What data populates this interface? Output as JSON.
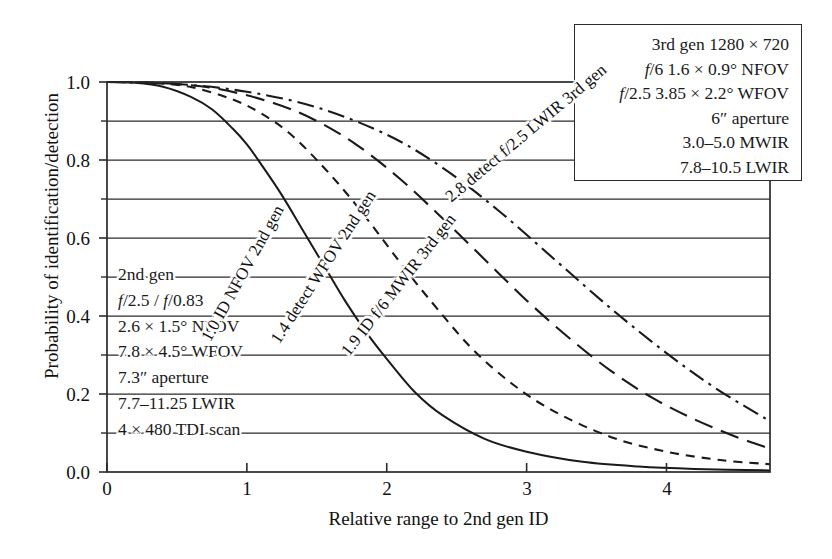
{
  "chart_data": {
    "type": "line",
    "title": "",
    "xlabel": "Relative range to 2nd gen ID",
    "ylabel": "Probability of identification/detection",
    "xlim": [
      0,
      4.74
    ],
    "ylim": [
      0.0,
      1.0
    ],
    "xticks": [
      "0",
      "1",
      "2",
      "3",
      "4"
    ],
    "xtick_values": [
      0,
      1,
      2,
      3,
      4
    ],
    "yticks": [
      "0.0",
      "0.2",
      "0.4",
      "0.6",
      "0.8",
      "1.0"
    ],
    "ytick_values": [
      0.0,
      0.2,
      0.4,
      0.6,
      0.8,
      1.0
    ],
    "y_minor_ticks": [
      0.1,
      0.3,
      0.5,
      0.7,
      0.9
    ],
    "grid": "horizontal gridlines at every 0.1",
    "legend_position": "inline curve labels",
    "series": [
      {
        "name": "1.0 ID NFOV 2nd gen",
        "style": "solid",
        "range50": 1.0,
        "x": [
          0.0,
          0.2,
          0.4,
          0.6,
          0.75,
          0.9,
          1.0,
          1.1,
          1.25,
          1.4,
          1.55,
          1.7,
          1.85,
          2.0,
          2.2,
          2.4,
          2.7,
          3.0,
          3.4,
          3.8,
          4.2,
          4.74
        ],
        "y": [
          1.0,
          0.998,
          0.988,
          0.962,
          0.93,
          0.88,
          0.84,
          0.79,
          0.71,
          0.62,
          0.53,
          0.44,
          0.36,
          0.29,
          0.205,
          0.145,
          0.085,
          0.052,
          0.026,
          0.014,
          0.008,
          0.004
        ]
      },
      {
        "name": "1.4 detect WFOV 2nd gen",
        "style": "short-dash",
        "range50": 1.4,
        "x": [
          0.0,
          0.3,
          0.6,
          0.9,
          1.1,
          1.3,
          1.5,
          1.7,
          1.9,
          2.1,
          2.3,
          2.6,
          2.9,
          3.2,
          3.6,
          4.0,
          4.4,
          4.74
        ],
        "y": [
          1.0,
          0.998,
          0.987,
          0.955,
          0.92,
          0.87,
          0.8,
          0.72,
          0.63,
          0.535,
          0.445,
          0.32,
          0.225,
          0.155,
          0.09,
          0.052,
          0.03,
          0.02
        ]
      },
      {
        "name": "1.9 ID f/6 MWIR 3rd gen",
        "style": "long-dash",
        "range50": 1.9,
        "x": [
          0.0,
          0.4,
          0.8,
          1.2,
          1.5,
          1.8,
          2.1,
          2.4,
          2.7,
          3.0,
          3.3,
          3.6,
          3.9,
          4.2,
          4.5,
          4.74
        ],
        "y": [
          1.0,
          0.997,
          0.982,
          0.945,
          0.9,
          0.835,
          0.75,
          0.65,
          0.545,
          0.44,
          0.345,
          0.26,
          0.19,
          0.135,
          0.09,
          0.06
        ]
      },
      {
        "name": "2.8 detect f/2.5 LWIR 3rd gen",
        "style": "dash-dot",
        "range50": 2.8,
        "x": [
          0.0,
          0.5,
          1.0,
          1.5,
          2.0,
          2.4,
          2.8,
          3.2,
          3.6,
          4.0,
          4.35,
          4.74
        ],
        "y": [
          1.0,
          0.995,
          0.975,
          0.935,
          0.865,
          0.78,
          0.67,
          0.545,
          0.42,
          0.305,
          0.215,
          0.13
        ]
      }
    ],
    "curve_labels": [
      "1.0 ID NFOV 2nd gen",
      "1.4 detect WFOV 2nd gen",
      "1.9 ID f/6 MWIR 3rd gen",
      "2.8 detect f/2.5 LWIR 3rd gen"
    ]
  },
  "axes": {
    "ylabel": "Probability of identification/detection",
    "xlabel": "Relative range to 2nd gen ID",
    "ytick_labels": [
      "1.0",
      "0.8",
      "0.6",
      "0.4",
      "0.2",
      "0.0"
    ],
    "xtick_labels": [
      "0",
      "1",
      "2",
      "3",
      "4"
    ]
  },
  "legend_box": {
    "lines": [
      "3rd gen 1280 × 720",
      "f/6 1.6 × 0.9° NFOV",
      "f/2.5 3.85 × 2.2° WFOV",
      "6″ aperture",
      "3.0–5.0 MWIR",
      "7.8–10.5 LWIR"
    ]
  },
  "annotation_box": {
    "lines": [
      "2nd gen",
      "f/2.5 / f/0.83",
      "2.6 × 1.5° NFOV",
      "7.8 × 4.5° WFOV",
      "7.3″ aperture",
      "7.7–11.25 LWIR",
      "4 × 480 TDI scan"
    ]
  },
  "curve_label_1": "1.0 ID NFOV 2nd gen",
  "curve_label_2": "1.4 detect WFOV 2nd gen",
  "curve_label_3": "1.9 ID f/6 MWIR 3rd gen",
  "curve_label_4": "2.8 detect f/2.5 LWIR 3rd gen",
  "colors": {
    "ink": "#1a1a1a",
    "background": "#ffffff"
  }
}
